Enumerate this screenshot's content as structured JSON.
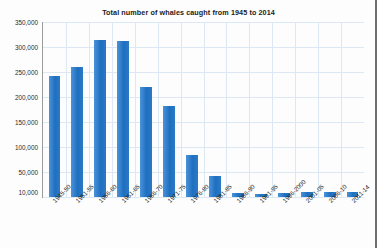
{
  "chart_data": {
    "type": "bar",
    "title": "Total number of whales caught from 1945 to 2014",
    "xlabel": "",
    "ylabel": "",
    "ylim": [
      0,
      350000
    ],
    "ytick_step": 50000,
    "grid": true,
    "legend": false,
    "bar_color": "#2b7ccb",
    "categories": [
      "1945-50",
      "1951-55",
      "1956-60",
      "1961-65",
      "1966-70",
      "1971-75",
      "1976-80",
      "1981-85",
      "1986-90",
      "1991-95",
      "1996-2000",
      "2001-05",
      "2006-10",
      "2011-14"
    ],
    "values": [
      243000,
      260000,
      315000,
      313000,
      220000,
      183000,
      84000,
      43000,
      9000,
      7000,
      9000,
      11000,
      11000,
      10000
    ],
    "yticks": [
      "350,000",
      "300,000",
      "250,000",
      "200,000",
      "150,000",
      "100,000",
      "50,000",
      "10,000"
    ],
    "ytick_values": [
      350000,
      300000,
      250000,
      200000,
      150000,
      100000,
      50000,
      10000
    ]
  }
}
